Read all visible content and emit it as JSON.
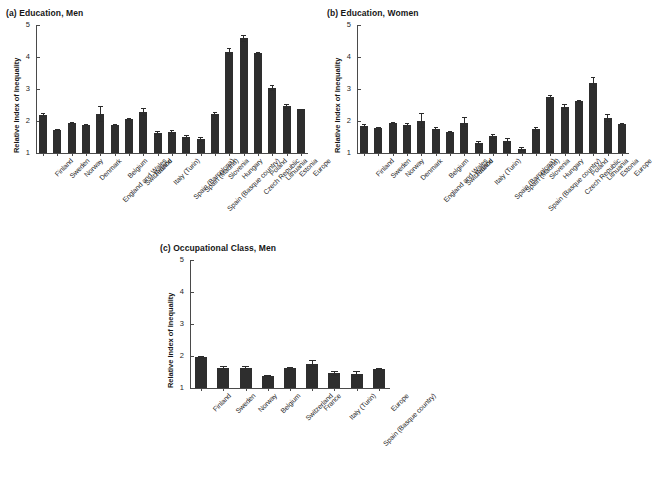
{
  "figure": {
    "ylabel": "Relative Index of Inequality",
    "yticks": [
      1,
      2,
      3,
      4,
      5
    ],
    "ylim": [
      1,
      5
    ]
  },
  "panels": [
    {
      "id": "a",
      "title": "(a) Education, Men"
    },
    {
      "id": "b",
      "title": "(b) Education, Women"
    },
    {
      "id": "c",
      "title": "(c) Occupational Class, Men"
    }
  ],
  "chart_data": [
    {
      "type": "bar",
      "panel": "a",
      "title": "(a) Education, Men",
      "xlabel": "",
      "ylabel": "Relative Index of Inequality",
      "ylim": [
        1,
        5
      ],
      "yticks": [
        1,
        2,
        3,
        4,
        5
      ],
      "grid": false,
      "legend": "none",
      "error_bars": "95% confidence interval",
      "categories": [
        "Finland",
        "Sweden",
        "Norway",
        "Denmark",
        "England and Wales",
        "Belgium",
        "Switzerland",
        "France",
        "Italy (Turin)",
        "Spain (Barcelona)",
        "Spain (Madrid)",
        "Spain (Basque country)",
        "Slovenia",
        "Hungary",
        "Czech Republic",
        "Poland",
        "Lithuania",
        "Estonia",
        "Europe"
      ],
      "values": [
        2.19,
        1.72,
        1.95,
        1.88,
        2.22,
        1.87,
        2.05,
        2.27,
        1.62,
        1.66,
        1.5,
        1.43,
        2.23,
        4.17,
        4.58,
        4.11,
        3.04,
        2.46,
        2.36
      ],
      "err_low": [
        2.12,
        1.68,
        1.92,
        1.84,
        1.98,
        1.84,
        2.0,
        2.15,
        1.56,
        1.59,
        1.43,
        1.35,
        2.17,
        4.07,
        4.48,
        4.06,
        2.94,
        2.38,
        2.34
      ],
      "err_high": [
        2.26,
        1.76,
        1.98,
        1.92,
        2.47,
        1.9,
        2.1,
        2.4,
        1.68,
        1.73,
        1.57,
        1.51,
        2.29,
        4.27,
        4.68,
        4.16,
        3.14,
        2.54,
        2.38
      ]
    },
    {
      "type": "bar",
      "panel": "b",
      "title": "(b) Education, Women",
      "xlabel": "",
      "ylabel": "Relative Index of Inequality",
      "ylim": [
        1,
        5
      ],
      "yticks": [
        1,
        2,
        3,
        4,
        5
      ],
      "grid": false,
      "legend": "none",
      "error_bars": "95% confidence interval",
      "categories": [
        "Finland",
        "Sweden",
        "Norway",
        "Denmark",
        "England and Wales",
        "Belgium",
        "Switzerland",
        "France",
        "Italy (Turin)",
        "Spain (Barcelona)",
        "Spain (Madrid)",
        "Spain (Basque country)",
        "Slovenia",
        "Hungary",
        "Czech Republic",
        "Poland",
        "Lithuania",
        "Estonia",
        "Europe"
      ],
      "values": [
        1.84,
        1.77,
        1.94,
        1.89,
        2.01,
        1.76,
        1.66,
        1.95,
        1.31,
        1.52,
        1.37,
        1.12,
        1.74,
        2.74,
        2.45,
        2.61,
        3.2,
        2.09,
        1.92
      ],
      "err_low": [
        1.78,
        1.73,
        1.9,
        1.84,
        1.78,
        1.72,
        1.62,
        1.8,
        1.25,
        1.45,
        1.28,
        1.05,
        1.67,
        2.67,
        2.38,
        2.57,
        3.03,
        1.97,
        1.9
      ],
      "err_high": [
        1.9,
        1.81,
        1.98,
        1.94,
        2.26,
        1.8,
        1.7,
        2.11,
        1.37,
        1.59,
        1.46,
        1.19,
        1.81,
        2.81,
        2.52,
        2.65,
        3.37,
        2.21,
        1.94
      ]
    },
    {
      "type": "bar",
      "panel": "c",
      "title": "(c) Occupational Class, Men",
      "xlabel": "",
      "ylabel": "Relative Index of Inequality",
      "ylim": [
        1,
        5
      ],
      "yticks": [
        1,
        2,
        3,
        4,
        5
      ],
      "grid": false,
      "legend": "none",
      "error_bars": "95% confidence interval",
      "categories": [
        "Finland",
        "Sweden",
        "Norway",
        "Belgium",
        "Switzerland",
        "France",
        "Italy (Turin)",
        "Spain (Basque country)",
        "Europe"
      ],
      "values": [
        1.96,
        1.64,
        1.63,
        1.38,
        1.62,
        1.76,
        1.46,
        1.43,
        1.59
      ],
      "err_low": [
        1.92,
        1.59,
        1.58,
        1.34,
        1.57,
        1.66,
        1.38,
        1.34,
        1.55
      ],
      "err_high": [
        2.0,
        1.69,
        1.68,
        1.42,
        1.67,
        1.86,
        1.54,
        1.52,
        1.63
      ]
    }
  ]
}
